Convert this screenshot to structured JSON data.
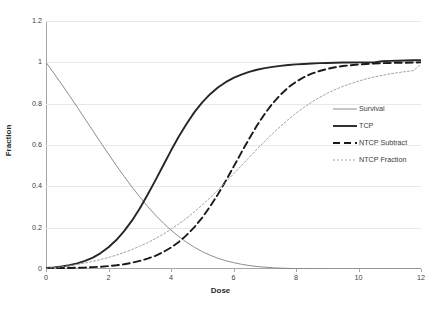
{
  "chart_data": {
    "type": "line",
    "title": "",
    "xlabel": "Dose",
    "ylabel": "Fraction",
    "xlim": [
      0,
      12
    ],
    "ylim": [
      0,
      1.2
    ],
    "grid": true,
    "grid_axis": "y",
    "legend_position": "right-inside",
    "xticks": [
      "0",
      "2",
      "4",
      "6",
      "8",
      "10",
      "12"
    ],
    "yticks": [
      "0",
      "0.2",
      "0.4",
      "0.6",
      "0.8",
      "1",
      "1.2"
    ],
    "x": [
      0,
      0.25,
      0.5,
      0.75,
      1,
      1.25,
      1.5,
      1.75,
      2,
      2.25,
      2.5,
      2.75,
      3,
      3.25,
      3.5,
      3.75,
      4,
      4.25,
      4.5,
      4.75,
      5,
      5.25,
      5.5,
      5.75,
      6,
      6.25,
      6.5,
      6.75,
      7,
      7.25,
      7.5,
      7.75,
      8,
      8.25,
      8.5,
      8.75,
      9,
      9.25,
      9.5,
      9.75,
      10,
      10.25,
      10.5,
      10.75,
      11,
      11.25,
      11.5,
      11.75,
      12
    ],
    "series": [
      {
        "name": "Survival",
        "style": "solid",
        "width": "thin",
        "color": "#808080",
        "values": [
          1.0,
          0.948,
          0.894,
          0.839,
          0.783,
          0.726,
          0.669,
          0.612,
          0.556,
          0.501,
          0.448,
          0.397,
          0.349,
          0.303,
          0.261,
          0.223,
          0.188,
          0.157,
          0.129,
          0.105,
          0.084,
          0.067,
          0.052,
          0.04,
          0.031,
          0.023,
          0.017,
          0.012,
          0.009,
          0.006,
          0.004,
          0.003,
          0.002,
          0.001,
          0.001,
          0.001,
          0.0,
          0.0,
          0.0,
          0.0,
          0.0,
          0.0,
          0.0,
          0.0,
          0.0,
          0.0,
          0.0,
          0.0,
          0.0
        ]
      },
      {
        "name": "TCP",
        "style": "solid",
        "width": "thick",
        "color": "#262626",
        "values": [
          0.005,
          0.008,
          0.012,
          0.018,
          0.027,
          0.039,
          0.055,
          0.077,
          0.105,
          0.14,
          0.183,
          0.234,
          0.293,
          0.359,
          0.429,
          0.501,
          0.573,
          0.641,
          0.703,
          0.759,
          0.806,
          0.846,
          0.878,
          0.904,
          0.925,
          0.941,
          0.954,
          0.964,
          0.972,
          0.978,
          0.983,
          0.987,
          0.99,
          0.992,
          0.994,
          0.996,
          0.997,
          0.998,
          0.999,
          0.999,
          1.0,
          1.0,
          1.0,
          1.005,
          1.007,
          1.008,
          1.009,
          1.01,
          1.01
        ]
      },
      {
        "name": "NTCP Subtract",
        "style": "dashed",
        "width": "thick",
        "color": "#1a1a1a",
        "values": [
          0.004,
          0.004,
          0.005,
          0.005,
          0.006,
          0.007,
          0.009,
          0.011,
          0.014,
          0.018,
          0.023,
          0.03,
          0.039,
          0.05,
          0.064,
          0.082,
          0.104,
          0.131,
          0.164,
          0.203,
          0.249,
          0.302,
          0.361,
          0.426,
          0.494,
          0.563,
          0.63,
          0.694,
          0.751,
          0.801,
          0.843,
          0.878,
          0.906,
          0.928,
          0.945,
          0.958,
          0.968,
          0.976,
          0.982,
          0.986,
          0.99,
          0.992,
          0.994,
          0.996,
          0.997,
          0.998,
          0.998,
          0.999,
          1.0
        ]
      },
      {
        "name": "NTCP Fraction",
        "style": "dotted",
        "width": "thin",
        "color": "#9a9a9a",
        "values": [
          0.004,
          0.007,
          0.011,
          0.016,
          0.022,
          0.029,
          0.037,
          0.046,
          0.056,
          0.067,
          0.08,
          0.094,
          0.11,
          0.127,
          0.147,
          0.168,
          0.192,
          0.218,
          0.246,
          0.277,
          0.31,
          0.345,
          0.382,
          0.42,
          0.46,
          0.5,
          0.54,
          0.58,
          0.618,
          0.655,
          0.69,
          0.723,
          0.754,
          0.782,
          0.807,
          0.83,
          0.85,
          0.868,
          0.884,
          0.897,
          0.909,
          0.92,
          0.929,
          0.937,
          0.944,
          0.95,
          0.955,
          0.96,
          0.99
        ]
      }
    ]
  },
  "legend": {
    "items": [
      {
        "label": "Survival"
      },
      {
        "label": "TCP"
      },
      {
        "label": "NTCP Subtract"
      },
      {
        "label": "NTCP Fraction"
      }
    ]
  },
  "axes": {
    "x_title": "Dose",
    "y_title": "Fraction"
  }
}
